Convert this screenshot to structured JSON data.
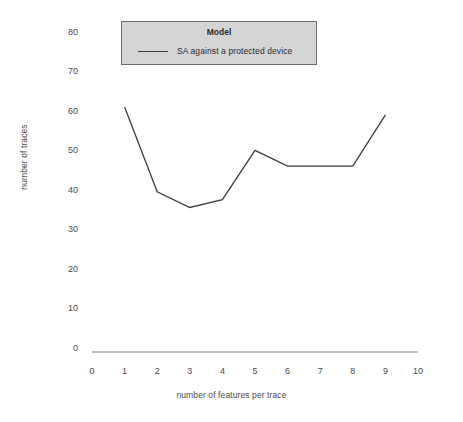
{
  "chart_data": {
    "type": "line",
    "title": "",
    "xlabel": "number of features per trace",
    "ylabel": "number of traces",
    "xlim": [
      0,
      10
    ],
    "ylim": [
      0,
      80
    ],
    "xticks": [
      "0",
      "1",
      "2",
      "3",
      "4",
      "5",
      "6",
      "7",
      "8",
      "9",
      "10"
    ],
    "yticks": [
      "0",
      "10",
      "20",
      "30",
      "40",
      "50",
      "60",
      "70",
      "80"
    ],
    "grid": false,
    "legend": {
      "title": "Model",
      "position": "upper-center",
      "entries": [
        {
          "name": "SA against a protected device",
          "marker": "line",
          "color": "#3c3c3c"
        }
      ]
    },
    "series": [
      {
        "name": "SA against a protected device",
        "color": "#3c3c3c",
        "x": [
          1,
          2,
          3,
          4,
          5,
          6,
          7,
          8,
          9
        ],
        "values": [
          61,
          39.5,
          35.5,
          37.5,
          50,
          46,
          46,
          46,
          59
        ]
      }
    ]
  },
  "colors": {
    "line": "#3c3c3c",
    "axis": "#7a7a7a",
    "legend_background": "#d4d4d4",
    "legend_border": "#6e6e6e",
    "text": "#4a4a4a",
    "background": "#ffffff"
  }
}
